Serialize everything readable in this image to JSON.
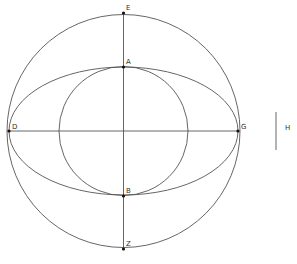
{
  "diagram": {
    "center": {
      "x": 123.5,
      "y": 131
    },
    "big_circle": {
      "r": 116.5
    },
    "inner_circle": {
      "r": 64.5
    },
    "ellipse": {
      "rx": 114.5,
      "ry": 64
    },
    "stroke_color": "#555555",
    "points": [
      {
        "id": "E",
        "label": "E",
        "x": 123.5,
        "y": 13,
        "lx": 126,
        "ly": 10
      },
      {
        "id": "A",
        "label": "A",
        "x": 123.5,
        "y": 67,
        "lx": 126,
        "ly": 64
      },
      {
        "id": "D",
        "label": "D",
        "x": 9,
        "y": 131,
        "lx": 12,
        "ly": 129
      },
      {
        "id": "G",
        "label": "G",
        "x": 238,
        "y": 131,
        "lx": 241,
        "ly": 129
      },
      {
        "id": "B",
        "label": "B",
        "x": 123.5,
        "y": 196,
        "lx": 126,
        "ly": 193
      },
      {
        "id": "Z",
        "label": "Z",
        "x": 123.5,
        "y": 249,
        "lx": 126,
        "ly": 246
      }
    ],
    "segment_H": {
      "label": "H",
      "x": 276,
      "y1": 112,
      "y2": 150,
      "lx": 285,
      "ly": 130
    }
  }
}
